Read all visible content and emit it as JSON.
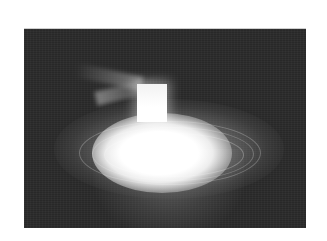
{
  "image": {
    "description": "Grayscale photograph of a bright glowing plasma discharge: a luminous rectangular block atop an intense elliptical glow with concentric rings, faint diagonal rays, on a dark background",
    "colors": {
      "page_background": "#ffffff",
      "photo_background": "#2a2a2a",
      "glow_core": "#ffffff"
    }
  }
}
